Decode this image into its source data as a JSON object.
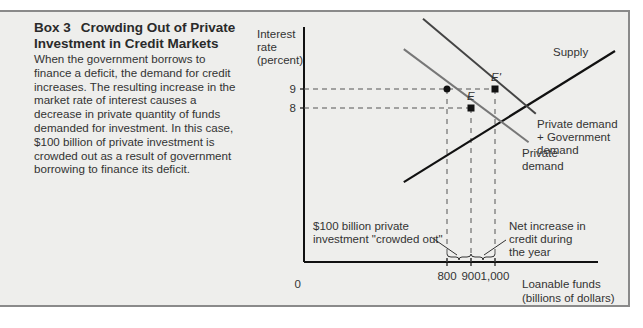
{
  "box": {
    "number": "Box 3",
    "title": "Crowding Out of Private Investment in Credit Markets",
    "body": "When the government borrows to finance a deficit, the demand for credit increases. The resulting increase in the market rate of interest causes a decrease in private quantity of funds demanded for investment. In this case, $100 billion of private investment is crowded out as a result of government borrowing to finance its deficit."
  },
  "chart_data": {
    "type": "line",
    "title": "Crowding Out of Private Investment in Credit Markets",
    "ylabel": [
      "Interest",
      "rate",
      "(percent)"
    ],
    "xlabel": [
      "Loanable funds",
      "(billions of dollars)"
    ],
    "origin_label": "0",
    "y_ticks": [
      {
        "value": 9,
        "label": "9"
      },
      {
        "value": 8,
        "label": "8"
      }
    ],
    "x_ticks": [
      {
        "value": 800,
        "label": "800"
      },
      {
        "value": 900,
        "label": "900"
      },
      {
        "value": 1000,
        "label": "1,000"
      }
    ],
    "series": [
      {
        "name": "Supply",
        "label": [
          "Supply"
        ],
        "color": "#111111",
        "points": [
          [
            620,
            4.1
          ],
          [
            1500,
            11.0
          ]
        ]
      },
      {
        "name": "Private demand",
        "label": [
          "Private",
          "demand"
        ],
        "color": "#777777",
        "points": [
          [
            620,
            11.1
          ],
          [
            1140,
            6.2
          ]
        ]
      },
      {
        "name": "Private demand + Government demand",
        "label": [
          "Private demand",
          "+ Government",
          "demand"
        ],
        "color": "#444444",
        "points": [
          [
            700,
            12.7
          ],
          [
            1170,
            7.7
          ]
        ]
      }
    ],
    "points": [
      {
        "name": "E",
        "x": 900,
        "y": 8
      },
      {
        "name": "E'",
        "x": 1000,
        "y": 9
      },
      {
        "name": "",
        "x": 800,
        "y": 9
      }
    ],
    "annotations": {
      "crowded_out": [
        "$100 billion private",
        "investment \"crowded out\""
      ],
      "net_increase": [
        "Net increase in",
        "credit during",
        "the year"
      ]
    }
  }
}
